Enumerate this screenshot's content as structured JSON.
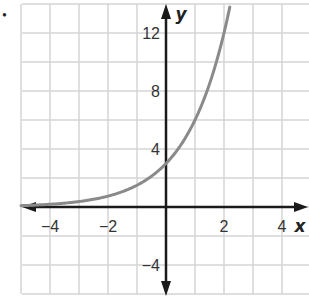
{
  "chart_data": {
    "type": "line",
    "title": "",
    "xlabel": "x",
    "ylabel": "y",
    "xlim": [
      -5,
      4.9
    ],
    "ylim": [
      -6,
      14
    ],
    "grid": true,
    "grid_step_x": 1,
    "grid_step_y": 2,
    "x_tick_labels": [
      "−4",
      "−2",
      "2",
      "4"
    ],
    "x_tick_values": [
      -4,
      -2,
      2,
      4
    ],
    "y_tick_labels": [
      "12",
      "8",
      "4",
      "−4"
    ],
    "y_tick_values": [
      12,
      8,
      4,
      -4
    ],
    "series": [
      {
        "name": "exponential curve",
        "function": "y = 3·2^x",
        "color": "#8a8a8a",
        "x": [
          -5,
          -4,
          -3,
          -2,
          -1,
          0,
          1,
          2,
          2.2
        ],
        "y": [
          0.09,
          0.19,
          0.38,
          0.75,
          1.5,
          3,
          6,
          12,
          13.8
        ]
      }
    ],
    "colors": {
      "grid": "#d4d4d4",
      "axis": "#1a1a1a",
      "curve": "#8a8a8a"
    }
  },
  "marker": "•"
}
